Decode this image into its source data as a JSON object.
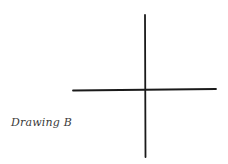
{
  "caption": "Drawing B",
  "figure": {
    "type": "cross",
    "vertical_line": {
      "x": 145,
      "y1": 15,
      "y2": 157
    },
    "horizontal_line": {
      "y": 90,
      "x1": 73,
      "x2": 216
    },
    "stroke_color": "#1a1a1a"
  }
}
